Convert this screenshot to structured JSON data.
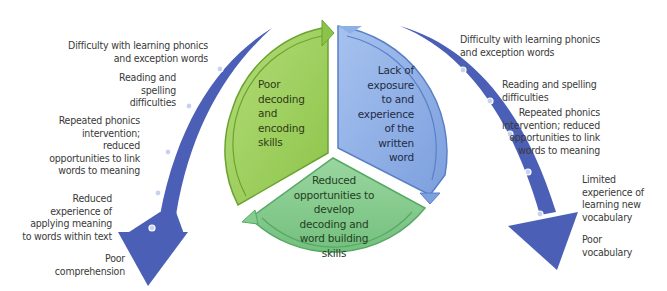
{
  "colors": {
    "green_segment": "#9ccf5c",
    "green_segment_dark": "#6aa32f",
    "blue_segment": "#8fb0e6",
    "blue_segment_dark": "#5b7fc7",
    "bottom_segment": "#86cc8f",
    "bottom_segment_dark": "#56a865",
    "arrow_blue": "#4a5fb5",
    "dot_fill": "#c8d2f0",
    "text": "#3a3a3a"
  },
  "cycle": {
    "segments": [
      {
        "id": "green",
        "lines": [
          "Poor",
          "decoding",
          "and",
          "encoding",
          "skills"
        ]
      },
      {
        "id": "blue",
        "lines": [
          "Lack of",
          "exposure",
          "to and",
          "experience",
          "of the",
          "written",
          "word"
        ]
      },
      {
        "id": "bottom",
        "lines": [
          "Reduced",
          "opportunities to",
          "develop",
          "decoding and",
          "word building",
          "skills"
        ]
      }
    ]
  },
  "left_arrow": {
    "labels": [
      {
        "lines": [
          "Difficulty with learning phonics",
          "and exception words"
        ]
      },
      {
        "lines": [
          "Reading and",
          "spelling",
          "difficulties"
        ]
      },
      {
        "lines": [
          "Repeated phonics",
          "intervention;",
          "reduced",
          "opportunities to link",
          "words to meaning"
        ]
      },
      {
        "lines": [
          "Reduced",
          "experience of",
          "applying meaning",
          "to words within text"
        ]
      },
      {
        "lines": [
          "Poor",
          "comprehension"
        ]
      }
    ]
  },
  "right_arrow": {
    "labels": [
      {
        "lines": [
          "Difficulty with learning phonics",
          "and exception words"
        ]
      },
      {
        "lines": [
          "Reading and spelling",
          "difficulties"
        ]
      },
      {
        "lines": [
          "Repeated phonics",
          "intervention; reduced",
          "opportunities to link",
          "words to meaning"
        ]
      },
      {
        "lines": [
          "Limited",
          "experience of",
          "learning new",
          "vocabulary"
        ]
      },
      {
        "lines": [
          "Poor",
          "vocabulary"
        ]
      }
    ]
  }
}
